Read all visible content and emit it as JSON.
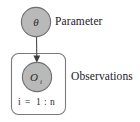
{
  "figure": {
    "type": "plate-notation-graphical-model",
    "background_color": "#ffffff",
    "node_fill_color": "#b9b9b9",
    "node_stroke_color": "#6f6f6f",
    "plate_stroke_color": "#7a7a7a",
    "edge_color": "#4a4a4a",
    "text_color": "#23201f"
  },
  "nodes": {
    "parameter": {
      "symbol": "θ",
      "label": "Parameter",
      "shape": "circle",
      "shaded": true,
      "cx": 36,
      "cy": 22,
      "r": 15
    },
    "observation": {
      "symbol": "O",
      "subscript": "i",
      "label": "Observations",
      "shape": "circle",
      "shaded": true,
      "cx": 37,
      "cy": 77,
      "r": 15
    }
  },
  "plate": {
    "index_label": "i = 1 : n",
    "index_var": "i",
    "index_equals": "=",
    "index_start": "1",
    "index_colon": ":",
    "index_end": "n",
    "x": 11,
    "y": 53,
    "width": 55,
    "height": 62,
    "corner_radius": 7
  },
  "edges": [
    {
      "from": "parameter",
      "to": "observation",
      "directed": true,
      "arrowhead": "filled-triangle"
    }
  ]
}
